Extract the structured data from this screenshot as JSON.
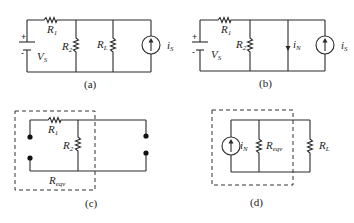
{
  "figure": {
    "panels": [
      {
        "id": "a",
        "caption": "(a)",
        "labels": {
          "R1": "R",
          "R1_sub": "1",
          "R2": "R",
          "R2_sub": "2",
          "RL": "R",
          "RL_sub": "L",
          "VS": "V",
          "VS_sub": "S",
          "iS": "i",
          "iS_sub": "S",
          "plus": "+",
          "minus": "-"
        }
      },
      {
        "id": "b",
        "caption": "(b)",
        "labels": {
          "R1": "R",
          "R1_sub": "1",
          "R2": "R",
          "R2_sub": "2",
          "iN": "i",
          "iN_sub": "N",
          "VS": "V",
          "VS_sub": "S",
          "iS": "i",
          "iS_sub": "S",
          "plus": "+",
          "minus": "-"
        }
      },
      {
        "id": "c",
        "caption": "(c)",
        "labels": {
          "R1": "R",
          "R1_sub": "1",
          "R2": "R",
          "R2_sub": "2",
          "Reqv": "R",
          "Reqv_sub": "eqv"
        }
      },
      {
        "id": "d",
        "caption": "(d)",
        "labels": {
          "iN": "i",
          "iN_sub": "N",
          "Reqv": "R",
          "Reqv_sub": "eqv",
          "RL": "R",
          "RL_sub": "L"
        }
      }
    ],
    "colors": {
      "ink": "#2a2a2a",
      "background": "#ffffff"
    }
  }
}
